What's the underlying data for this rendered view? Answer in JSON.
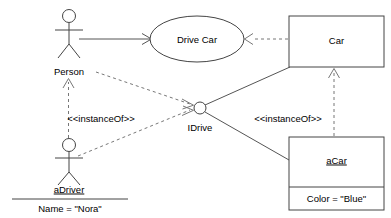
{
  "diagram": {
    "background_color": "#ffffff",
    "line_color": "#555555",
    "dashed_line_color": "#777777",
    "text_color": "#000000",
    "nodes": {
      "person_actor": {
        "label": "Person",
        "kind": "actor",
        "cx": 69,
        "label_y": 72
      },
      "drive_car_usecase": {
        "label": "Drive Car",
        "kind": "ellipse",
        "cx": 197,
        "cy": 39
      },
      "car_class": {
        "label": "Car",
        "kind": "class-box",
        "x": 289,
        "y": 16,
        "w": 95,
        "h": 51
      },
      "idrive_interface": {
        "label": "IDrive",
        "kind": "interface-ball",
        "cx": 200,
        "cy": 108,
        "r": 6,
        "label_y": 128
      },
      "adriver_instance": {
        "label": "aDriver",
        "attribute": "Name = \"Nora\"",
        "kind": "actor-instance",
        "cx": 69,
        "label_y": 188
      },
      "acar_instance": {
        "label": "aCar",
        "attribute": "Color = \"Blue\"",
        "kind": "object-box",
        "x": 289,
        "y": 137,
        "w": 95,
        "h": 73
      }
    },
    "edges": {
      "person_to_drivecar": {
        "label": "",
        "style": "solid",
        "arrow": "open"
      },
      "car_to_drivecar": {
        "label": "",
        "style": "dashed",
        "arrow": "open"
      },
      "adriver_to_person": {
        "label": "<<instanceOf>>",
        "style": "dashed",
        "arrow": "open",
        "label_x": 101,
        "label_y": 119
      },
      "acar_to_car": {
        "label": "<<instanceOf>>",
        "style": "dashed",
        "arrow": "open",
        "label_x": 288,
        "label_y": 119
      },
      "person_to_idrive": {
        "label": "",
        "style": "dashed",
        "arrow": "open"
      },
      "adriver_to_idrive": {
        "label": "",
        "style": "dashed",
        "arrow": "open"
      },
      "idrive_to_car": {
        "label": "",
        "style": "solid",
        "arrow": "none"
      },
      "idrive_to_acar": {
        "label": "",
        "style": "solid",
        "arrow": "none"
      }
    }
  }
}
